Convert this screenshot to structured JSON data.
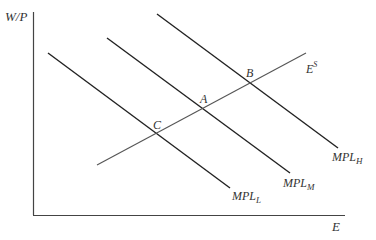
{
  "diagram": {
    "type": "labor-market-supply-demand",
    "axes": {
      "y_label": "W/P",
      "x_label": "E"
    },
    "curves": [
      {
        "id": "mpl_l",
        "label_main": "MPL",
        "label_sub": "L",
        "kind": "demand"
      },
      {
        "id": "mpl_m",
        "label_main": "MPL",
        "label_sub": "M",
        "kind": "demand"
      },
      {
        "id": "mpl_h",
        "label_main": "MPL",
        "label_sub": "H",
        "kind": "demand"
      },
      {
        "id": "e_s",
        "label_main": "E",
        "label_sup": "S",
        "kind": "supply"
      }
    ],
    "points": [
      {
        "label": "A",
        "desc": "intersection of E^S and MPL_M"
      },
      {
        "label": "B",
        "desc": "intersection of E^S and MPL_H"
      },
      {
        "label": "C",
        "desc": "intersection of E^S and MPL_L"
      }
    ],
    "colors": {
      "axis": "#444444",
      "demand_line": "#222222",
      "supply_line": "#555555",
      "text": "#333333"
    }
  }
}
